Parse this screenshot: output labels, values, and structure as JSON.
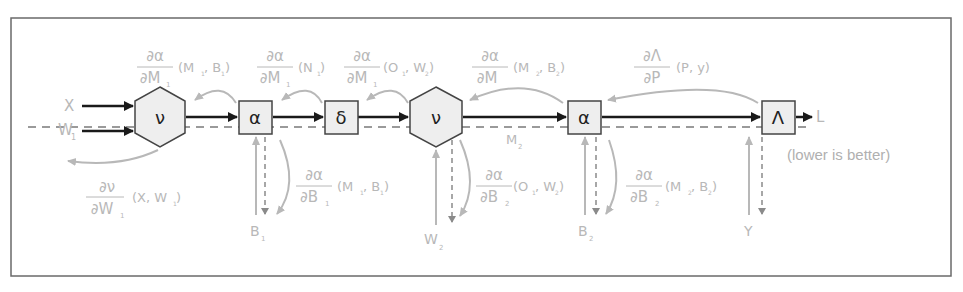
{
  "diagram": {
    "title": "",
    "colors": {
      "forward": "#1a1a1a",
      "backward": "#b8b8b8",
      "node_fill": "#eeeeee",
      "node_stroke": "#555555",
      "frame": "#666666",
      "dashed": "#9a9a9a"
    },
    "inputs": {
      "x": "X",
      "w1": "W",
      "w1_sub": "1",
      "b1": "B",
      "b1_sub": "1",
      "w2": "W",
      "w2_sub": "2",
      "b2": "B",
      "b2_sub": "2",
      "y": "Y"
    },
    "nodes": [
      {
        "id": "nu1",
        "shape": "hexagon",
        "symbol": "ν"
      },
      {
        "id": "alpha1",
        "shape": "box",
        "symbol": "α"
      },
      {
        "id": "delta",
        "shape": "box",
        "symbol": "δ"
      },
      {
        "id": "nu2",
        "shape": "hexagon",
        "symbol": "ν"
      },
      {
        "id": "alpha2",
        "shape": "box",
        "symbol": "α"
      },
      {
        "id": "lambda",
        "shape": "box",
        "symbol": "Λ"
      }
    ],
    "output": {
      "label": "L",
      "note": "(lower is better)"
    },
    "intermediate": {
      "m2": "M",
      "m2_sub": "2"
    },
    "gradients_top": [
      {
        "num": "∂α",
        "den": "∂M",
        "den_sub": "1",
        "args": "(M",
        "args_sub1": "1",
        "args_mid": ", B",
        "args_sub2": "1",
        "args_end": ")"
      },
      {
        "num": "∂α",
        "den": "∂M",
        "den_sub": "1",
        "args": "(N",
        "args_sub1": "1",
        "args_end": ")"
      },
      {
        "num": "∂α",
        "den": "∂M",
        "den_sub": "1",
        "args": "(O",
        "args_sub1": "1",
        "args_mid": ", W",
        "args_sub2": "2",
        "args_end": ")"
      },
      {
        "num": "∂α",
        "den": "∂M",
        "den_sub": "",
        "args": "(M",
        "args_sub1": "2",
        "args_mid": ", B",
        "args_sub2": "2",
        "args_end": ")"
      },
      {
        "num": "∂Λ",
        "den": "∂P",
        "args": "(P, y)"
      }
    ],
    "gradients_bottom": [
      {
        "num": "∂ν",
        "den": "∂W",
        "den_sub": "1",
        "args": "(X, W",
        "args_sub": "1",
        "args_end": ")"
      },
      {
        "num": "∂α",
        "den": "∂B",
        "den_sub": "1",
        "args": "(M",
        "args_sub1": "1",
        "args_mid": ", B",
        "args_sub2": "1",
        "args_end": ")"
      },
      {
        "num": "∂α",
        "den": "∂B",
        "den_sub": "2",
        "args": "(O",
        "args_sub1": "1",
        "args_mid": ", W",
        "args_sub2": "2",
        "args_end": ")"
      },
      {
        "num": "∂α",
        "den": "∂B",
        "den_sub": "2",
        "args": "(M",
        "args_sub1": "2",
        "args_mid": ", B",
        "args_sub2": "2",
        "args_end": ")"
      }
    ]
  }
}
